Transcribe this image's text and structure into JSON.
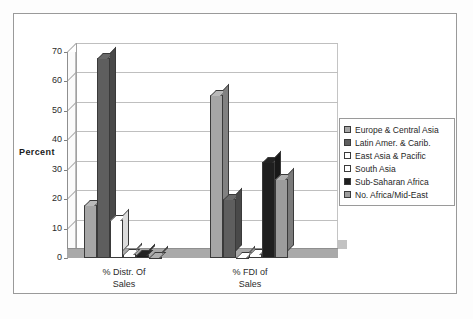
{
  "chart_data": {
    "type": "bar",
    "title": "",
    "xlabel": "",
    "ylabel": "Percent",
    "ylim": [
      0,
      70
    ],
    "yticks": [
      0,
      10,
      20,
      30,
      40,
      50,
      60,
      70
    ],
    "grid": true,
    "legend_position": "right",
    "categories": [
      "% Distr. Of Sales",
      "% FDI of Sales"
    ],
    "category_lines": [
      [
        "% Distr. Of",
        "Sales"
      ],
      [
        "% FDI of",
        "Sales"
      ]
    ],
    "series": [
      {
        "name": "Europe & Central Asia",
        "color": "#a6a6a6",
        "values": [
          18,
          55.5
        ]
      },
      {
        "name": "Latin Amer. & Carib.",
        "color": "#5e5e5e",
        "values": [
          68,
          20
        ]
      },
      {
        "name": "East Asia & Pacific",
        "color": "#ffffff",
        "values": [
          13,
          0.3
        ]
      },
      {
        "name": "South Asia",
        "color": "#ffffff",
        "values": [
          1.2,
          1.2
        ]
      },
      {
        "name": "Sub-Saharan Africa",
        "color": "#1f1f1f",
        "values": [
          1,
          32.5
        ]
      },
      {
        "name": "No. Africa/Mid-East",
        "color": "#9c9c9c",
        "values": [
          0.5,
          27
        ]
      }
    ]
  },
  "legend": {
    "items": [
      {
        "label": "Europe & Central Asia"
      },
      {
        "label": "Latin Amer. & Carib."
      },
      {
        "label": "East Asia & Pacific"
      },
      {
        "label": "South Asia"
      },
      {
        "label": "Sub-Saharan Africa"
      },
      {
        "label": "No. Africa/Mid-East"
      }
    ]
  }
}
